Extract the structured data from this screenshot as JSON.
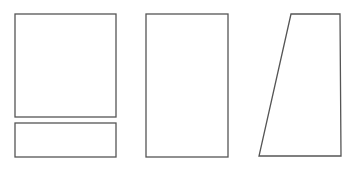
{
  "diagram": {
    "stroke_color": "#555555",
    "fill_color": "#ffffff",
    "background": "#ffffff",
    "shapes": [
      {
        "id": "square-top-left",
        "type": "rect",
        "x": 15,
        "y": 14,
        "width": 101,
        "height": 103
      },
      {
        "id": "rect-bottom-left",
        "type": "rect",
        "x": 15,
        "y": 123,
        "width": 101,
        "height": 34
      },
      {
        "id": "rect-tall-middle",
        "type": "rect",
        "x": 146,
        "y": 14,
        "width": 82,
        "height": 143
      },
      {
        "id": "trapezoid-right",
        "type": "polygon",
        "points": "291,14 340,14 341,156 259,156"
      }
    ]
  }
}
